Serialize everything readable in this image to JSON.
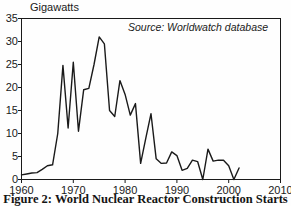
{
  "figure": {
    "caption": "Figure 2: World Nuclear Reactor Construction Starts",
    "y_axis_title": "Gigawatts",
    "source_note": "Source: Worldwatch database"
  },
  "chart_data": {
    "type": "line",
    "title": "World Nuclear Reactor Construction Starts",
    "xlabel": "",
    "ylabel": "Gigawatts",
    "xlim": [
      1960,
      2010
    ],
    "ylim": [
      0,
      35
    ],
    "xticks": [
      "1960",
      "1970",
      "1980",
      "1990",
      "2000",
      "2010"
    ],
    "yticks": [
      "0",
      "5",
      "10",
      "15",
      "20",
      "25",
      "30",
      "35"
    ],
    "grid": false,
    "legend": false,
    "annotations": [
      {
        "text": "Source: Worldwatch database",
        "x": 1985,
        "y": 32.5,
        "style": "italic"
      }
    ],
    "line_color": "#1a1a1a",
    "series": [
      {
        "name": "Construction starts (GW)",
        "x": [
          1960,
          1961,
          1962,
          1963,
          1964,
          1965,
          1966,
          1967,
          1968,
          1969,
          1970,
          1971,
          1972,
          1973,
          1974,
          1975,
          1976,
          1977,
          1978,
          1979,
          1980,
          1981,
          1982,
          1983,
          1984,
          1985,
          1986,
          1987,
          1988,
          1989,
          1990,
          1991,
          1992,
          1993,
          1994,
          1995,
          1996,
          1997,
          1998,
          1999,
          2000,
          2001,
          2002
        ],
        "values": [
          1.0,
          1.2,
          1.4,
          1.5,
          2.2,
          3.0,
          3.2,
          10.0,
          24.8,
          11.2,
          25.5,
          10.5,
          19.5,
          19.8,
          25.0,
          31.0,
          29.5,
          15.0,
          13.7,
          21.5,
          18.5,
          14.0,
          16.5,
          3.5,
          9.0,
          14.3,
          4.5,
          3.5,
          3.6,
          6.0,
          5.2,
          2.0,
          2.4,
          4.2,
          3.9,
          0.0,
          6.6,
          4.0,
          4.2,
          4.2,
          3.0,
          0.0,
          2.5
        ]
      }
    ]
  }
}
